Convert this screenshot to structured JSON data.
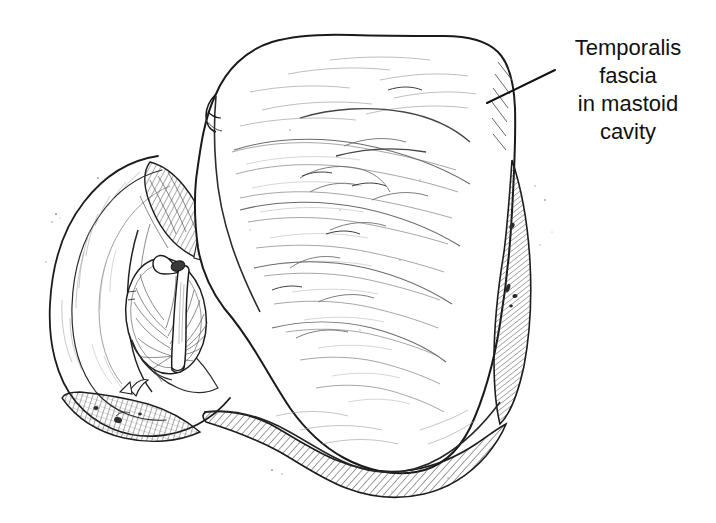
{
  "figure": {
    "kind": "medical-line-illustration",
    "background_color": "#ffffff",
    "ink_color": "#1a1a1a",
    "hatch_color": "#3a3a3a",
    "faint_texture_color": "#9a9a9a",
    "width": 716,
    "height": 523
  },
  "annotations": [
    {
      "id": "temporalis-fascia-label",
      "lines": [
        "Temporalis",
        "fascia",
        "in mastoid",
        "cavity"
      ],
      "text": "Temporalis\nfascia\nin mastoid\ncavity",
      "align": "center",
      "font_size_px": 22,
      "line_height_px": 28,
      "color": "#111111",
      "x": 540,
      "y": 34,
      "leader_line": {
        "from_x": 555,
        "from_y": 70,
        "to_x": 487,
        "to_y": 103,
        "color": "#111111",
        "width_px": 2
      }
    }
  ],
  "structures": [
    {
      "id": "temporalis-fascia-graft",
      "label": "Temporalis fascia in mastoid cavity",
      "shading": "faint wispy fiber strokes"
    },
    {
      "id": "auricle-helix",
      "label": "Auricle / helix",
      "shading": "soft contour strokes"
    },
    {
      "id": "ear-canal",
      "label": "External auditory canal",
      "shading": "diagonal hatching"
    },
    {
      "id": "tympanic-membrane",
      "label": "Tympanic membrane",
      "shading": "radiating fibers"
    },
    {
      "id": "malleus-handle",
      "label": "Handle of malleus",
      "shading": "outlined"
    },
    {
      "id": "bone-edge-right",
      "label": "Mastoid bone edge",
      "shading": "dense diagonal hatching"
    },
    {
      "id": "lobule-shadow",
      "label": "Lobule shadow",
      "shading": "cross hatching"
    },
    {
      "id": "inferior-bone-margin",
      "label": "Inferior mastoid margin",
      "shading": "dense diagonal hatching"
    }
  ]
}
